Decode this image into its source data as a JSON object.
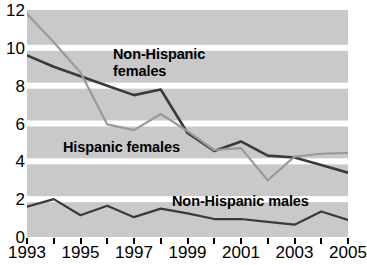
{
  "chart_data": {
    "type": "line",
    "title": "",
    "subtitle": "",
    "xlabel": "",
    "ylabel": "",
    "x": [
      1993,
      1994,
      1995,
      1996,
      1997,
      1998,
      1999,
      2000,
      2001,
      2002,
      2003,
      2004,
      2005
    ],
    "xlim": [
      1993,
      2005
    ],
    "ylim": [
      0,
      12
    ],
    "yticks": [
      0,
      2,
      4,
      6,
      8,
      10,
      12
    ],
    "ytick_labels": [
      "0",
      "2",
      "4",
      "6",
      "8",
      "10",
      "12"
    ],
    "xticks": [
      1993,
      1994,
      1995,
      1996,
      1997,
      1998,
      1999,
      2000,
      2001,
      2002,
      2003,
      2004,
      2005
    ],
    "xtick_labels": [
      "1993",
      "",
      "1995",
      "",
      "1997",
      "",
      "1999",
      "",
      "2001",
      "",
      "2003",
      "",
      "2005"
    ],
    "grid": "horizontal",
    "grid_color": "#ffffff",
    "plot_background": "#c9c9c9",
    "legend_position": "inline-annotations",
    "series": [
      {
        "name": "Non-Hispanic females",
        "color": "#3a3a3a",
        "line_width": 2.6,
        "values": [
          9.6,
          9.0,
          8.5,
          8.0,
          7.5,
          7.8,
          5.5,
          4.55,
          5.05,
          4.3,
          4.2,
          3.8,
          3.4
        ]
      },
      {
        "name": "Hispanic females",
        "color": "#9a9a9a",
        "line_width": 2.2,
        "values": [
          11.8,
          10.3,
          8.7,
          5.95,
          5.65,
          6.5,
          5.6,
          4.6,
          4.7,
          3.0,
          4.25,
          4.4,
          4.45
        ]
      },
      {
        "name": "Non-Hispanic males",
        "color": "#3a3a3a",
        "line_width": 2.2,
        "values": [
          1.6,
          2.0,
          1.15,
          1.65,
          1.05,
          1.5,
          1.25,
          0.95,
          0.95,
          0.8,
          0.65,
          1.35,
          0.9
        ]
      }
    ],
    "annotations": [
      {
        "name": "non-hispanic-females",
        "text": "Non-Hispanic\nfemales"
      },
      {
        "name": "hispanic-females",
        "text": "Hispanic females"
      },
      {
        "name": "non-hispanic-males",
        "text": "Non-Hispanic males"
      }
    ]
  }
}
